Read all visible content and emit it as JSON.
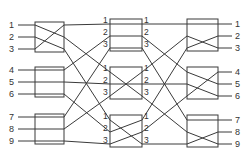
{
  "diagram": {
    "type": "three-stage-clos-network",
    "inputs": [
      "1",
      "2",
      "3",
      "4",
      "5",
      "6",
      "7",
      "8",
      "9"
    ],
    "outputs": [
      "1",
      "2",
      "3",
      "4",
      "5",
      "6",
      "7",
      "8",
      "9"
    ],
    "middle_port_labels": [
      "1",
      "2",
      "3"
    ],
    "stages": {
      "ingress": [
        {
          "name": "ingress-switch-1",
          "connections": [
            [
              1,
              2
            ],
            [
              2,
              3
            ],
            [
              3,
              1
            ]
          ]
        },
        {
          "name": "ingress-switch-2",
          "connections": [
            [
              1,
              1
            ],
            [
              2,
              2
            ],
            [
              3,
              3
            ]
          ]
        },
        {
          "name": "ingress-switch-3",
          "connections": [
            [
              1,
              1
            ],
            [
              2,
              2
            ],
            [
              3,
              3
            ]
          ]
        }
      ],
      "middle": [
        {
          "name": "middle-switch-1",
          "connections": [
            [
              1,
              1
            ],
            [
              2,
              2
            ],
            [
              3,
              3
            ]
          ]
        },
        {
          "name": "middle-switch-2",
          "connections": [
            [
              1,
              3
            ],
            [
              2,
              2
            ],
            [
              3,
              1
            ]
          ]
        },
        {
          "name": "middle-switch-3",
          "connections": [
            [
              1,
              3
            ],
            [
              2,
              1
            ],
            [
              3,
              2
            ]
          ]
        }
      ],
      "egress": [
        {
          "name": "egress-switch-1",
          "connections": [
            [
              1,
              1
            ],
            [
              2,
              3
            ],
            [
              3,
              2
            ]
          ]
        },
        {
          "name": "egress-switch-2",
          "connections": [
            [
              1,
              2
            ],
            [
              2,
              3
            ],
            [
              3,
              1
            ]
          ]
        },
        {
          "name": "egress-switch-3",
          "connections": [
            [
              1,
              1
            ],
            [
              2,
              3
            ],
            [
              3,
              2
            ]
          ]
        }
      ]
    },
    "colors": {
      "line": "#3a3a3a",
      "background": "#ffffff",
      "text": "#333333"
    }
  }
}
